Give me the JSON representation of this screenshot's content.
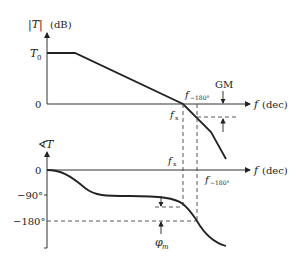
{
  "diagram": {
    "type": "bode-plot",
    "magnitude_plot": {
      "y_axis_label_symbol": "|T|",
      "y_axis_label_unit": "(dB)",
      "y_ticks": [
        "T0",
        "0"
      ],
      "y_tick_T0_main": "T",
      "y_tick_T0_sub": "0",
      "x_axis_label_symbol": "f",
      "x_axis_label_unit": "(dec)",
      "crossover_label_main": "f",
      "crossover_label_sub": "x",
      "phase_crossover_label_main": "f",
      "phase_crossover_label_sub": "−180°",
      "gain_margin_label": "GM"
    },
    "phase_plot": {
      "y_axis_label_symbol": "∢T",
      "y_ticks": [
        "0",
        "−90°",
        "−180°"
      ],
      "x_axis_label_symbol": "f",
      "x_axis_label_unit": "(dec)",
      "crossover_label_main": "f",
      "crossover_label_sub": "x",
      "phase_crossover_label_main": "f",
      "phase_crossover_label_sub": "−180°",
      "phase_margin_label_main": "φ",
      "phase_margin_label_sub": "m"
    },
    "colors": {
      "line": "#222222",
      "axis": "#333333",
      "dashed": "#444444"
    }
  }
}
